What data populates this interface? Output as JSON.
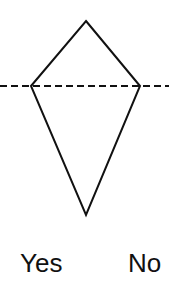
{
  "diagram": {
    "shape": "kite",
    "vertices": {
      "top": [
        86,
        21
      ],
      "left": [
        31,
        86
      ],
      "right": [
        140,
        86
      ],
      "bottom": [
        86,
        215
      ]
    },
    "symmetry_line": {
      "style": "dashed",
      "y": 86,
      "x1": 0,
      "x2": 169
    },
    "stroke_color": "#111111"
  },
  "options": [
    {
      "label": "Yes"
    },
    {
      "label": "No"
    }
  ]
}
